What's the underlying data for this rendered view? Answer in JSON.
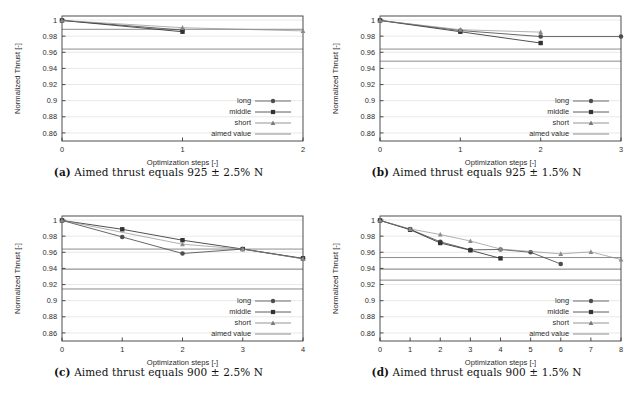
{
  "figure": {
    "title_implicit": "Normalized thrust versus optimization steps",
    "panel_count": 4
  },
  "common": {
    "ylabel": "Normalized Thrust [-]",
    "xlabel": "Optimization steps [-]",
    "yticks": [
      "1",
      "0.98",
      "0.96",
      "0.94",
      "0.92",
      "0.9",
      "0.88",
      "0.86"
    ],
    "ytick_values": [
      1,
      0.98,
      0.96,
      0.94,
      0.92,
      0.9,
      0.88,
      0.86
    ],
    "ylim": [
      0.85,
      1.005
    ],
    "legend": [
      {
        "label": "long",
        "marker": "circle-marker",
        "color": "#4d4d4d"
      },
      {
        "label": "middle",
        "marker": "square-marker",
        "color": "#333333"
      },
      {
        "label": "short",
        "marker": "triangle-marker",
        "color": "#7a7a7a"
      },
      {
        "label": "aimed value",
        "marker": "line-marker",
        "color": "#6e6e6e"
      }
    ],
    "colors": {
      "long": "#4d4d4d",
      "middle": "#333333",
      "short": "#8a8a8a",
      "aimed": "#6e6e6e",
      "grid": "#d8d8d8",
      "axis": "#3a3a3a",
      "background": "#ffffff"
    }
  },
  "panels": [
    {
      "id": "a",
      "caption_tag": "(a)",
      "caption_text": "Aimed thrust equals 925 ± 2.5% N",
      "chart_data": {
        "type": "line",
        "title": "Aimed thrust equals 925 ± 2.5% N",
        "xlabel": "Optimization steps [-]",
        "ylabel": "Normalized Thrust [-]",
        "xlim": [
          0,
          2
        ],
        "ylim": [
          0.85,
          1.005
        ],
        "xticks": [
          "0",
          "1",
          "2"
        ],
        "xtick_values": [
          0,
          1,
          2
        ],
        "yticks": [
          "1",
          "0.98",
          "0.96",
          "0.94",
          "0.92",
          "0.9",
          "0.88",
          "0.86"
        ],
        "grid": true,
        "legend_position": "lower-right",
        "series": [
          {
            "name": "long",
            "marker": "circle-marker",
            "x": [
              0,
              1
            ],
            "values": [
              0.9995,
              0.9875
            ]
          },
          {
            "name": "middle",
            "marker": "square-marker",
            "x": [
              0,
              1
            ],
            "values": [
              0.9995,
              0.9855
            ]
          },
          {
            "name": "short",
            "marker": "triangle-marker",
            "x": [
              0,
              1,
              2
            ],
            "values": [
              0.9995,
              0.9905,
              0.9865
            ]
          }
        ],
        "aimed_lines": [
          {
            "name": "aimed-upper",
            "value": 0.9885
          },
          {
            "name": "aimed-lower",
            "value": 0.964
          }
        ]
      }
    },
    {
      "id": "b",
      "caption_tag": "(b)",
      "caption_text": "Aimed thrust equals 925 ± 1.5% N",
      "chart_data": {
        "type": "line",
        "title": "Aimed thrust equals 925 ± 1.5% N",
        "xlabel": "Optimization steps [-]",
        "ylabel": "Normalized Thrust [-]",
        "xlim": [
          0,
          3
        ],
        "ylim": [
          0.85,
          1.005
        ],
        "xticks": [
          "0",
          "1",
          "2",
          "3"
        ],
        "xtick_values": [
          0,
          1,
          2,
          3
        ],
        "yticks": [
          "1",
          "0.98",
          "0.96",
          "0.94",
          "0.92",
          "0.9",
          "0.88",
          "0.86"
        ],
        "grid": true,
        "legend_position": "lower-right",
        "series": [
          {
            "name": "long",
            "marker": "circle-marker",
            "x": [
              0,
              1,
              2,
              3
            ],
            "values": [
              0.9995,
              0.987,
              0.9795,
              0.9795
            ]
          },
          {
            "name": "middle",
            "marker": "square-marker",
            "x": [
              0,
              1,
              2
            ],
            "values": [
              0.9995,
              0.9855,
              0.9715
            ]
          },
          {
            "name": "short",
            "marker": "triangle-marker",
            "x": [
              0,
              1,
              2
            ],
            "values": [
              0.9995,
              0.988,
              0.985
            ]
          }
        ],
        "aimed_lines": [
          {
            "name": "aimed-upper",
            "value": 0.964
          },
          {
            "name": "aimed-lower",
            "value": 0.949
          }
        ]
      }
    },
    {
      "id": "c",
      "caption_tag": "(c)",
      "caption_text": "Aimed thrust equals 900 ± 2.5% N",
      "chart_data": {
        "type": "line",
        "title": "Aimed thrust equals 900 ± 2.5% N",
        "xlabel": "Optimization steps [-]",
        "ylabel": "Normalized Thrust [-]",
        "xlim": [
          0,
          4
        ],
        "ylim": [
          0.85,
          1.005
        ],
        "xticks": [
          "0",
          "1",
          "2",
          "3",
          "4"
        ],
        "xtick_values": [
          0,
          1,
          2,
          3,
          4
        ],
        "yticks": [
          "1",
          "0.98",
          "0.96",
          "0.94",
          "0.92",
          "0.9",
          "0.88",
          "0.86"
        ],
        "grid": true,
        "legend_position": "lower-right",
        "series": [
          {
            "name": "long",
            "marker": "circle-marker",
            "x": [
              0,
              1,
              2,
              3,
              4
            ],
            "values": [
              0.9995,
              0.979,
              0.9585,
              0.964,
              0.952
            ]
          },
          {
            "name": "middle",
            "marker": "square-marker",
            "x": [
              0,
              1,
              2,
              3,
              4
            ],
            "values": [
              0.9995,
              0.9885,
              0.975,
              0.964,
              0.9525
            ]
          },
          {
            "name": "short",
            "marker": "triangle-marker",
            "x": [
              0,
              2,
              3,
              4
            ],
            "values": [
              0.9995,
              0.97,
              0.964,
              0.952
            ]
          }
        ],
        "aimed_lines": [
          {
            "name": "aimed-upper",
            "value": 0.964
          },
          {
            "name": "aimed-mid",
            "value": 0.939
          },
          {
            "name": "aimed-lower",
            "value": 0.9145
          }
        ]
      }
    },
    {
      "id": "d",
      "caption_tag": "(d)",
      "caption_text": "Aimed thrust equals 900 ± 1.5% N",
      "chart_data": {
        "type": "line",
        "title": "Aimed thrust equals 900 ± 1.5% N",
        "xlabel": "Optimization steps [-]",
        "ylabel": "Normalized Thrust [-]",
        "xlim": [
          0,
          8
        ],
        "ylim": [
          0.85,
          1.005
        ],
        "xticks": [
          "0",
          "1",
          "2",
          "3",
          "4",
          "5",
          "6",
          "7",
          "8"
        ],
        "xtick_values": [
          0,
          1,
          2,
          3,
          4,
          5,
          6,
          7,
          8
        ],
        "yticks": [
          "1",
          "0.98",
          "0.96",
          "0.94",
          "0.92",
          "0.9",
          "0.88",
          "0.86"
        ],
        "grid": true,
        "legend_position": "lower-right",
        "series": [
          {
            "name": "long",
            "marker": "circle-marker",
            "x": [
              0,
              1,
              2,
              3,
              4,
              5,
              6
            ],
            "values": [
              0.9995,
              0.9885,
              0.973,
              0.963,
              0.9635,
              0.96,
              0.9455
            ]
          },
          {
            "name": "middle",
            "marker": "square-marker",
            "x": [
              0,
              1,
              2,
              3,
              4
            ],
            "values": [
              0.9995,
              0.988,
              0.9715,
              0.9625,
              0.9525
            ]
          },
          {
            "name": "short",
            "marker": "triangle-marker",
            "x": [
              0,
              1,
              2,
              3,
              4,
              6,
              7,
              8
            ],
            "values": [
              0.9995,
              0.989,
              0.982,
              0.974,
              0.964,
              0.958,
              0.9605,
              0.951
            ]
          }
        ],
        "aimed_lines": [
          {
            "name": "aimed-upper",
            "value": 0.9535
          },
          {
            "name": "aimed-mid",
            "value": 0.939
          },
          {
            "name": "aimed-lower",
            "value": 0.9255
          }
        ]
      }
    }
  ]
}
